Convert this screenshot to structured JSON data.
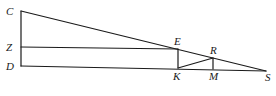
{
  "diagram": {
    "type": "geometry",
    "points": {
      "C": {
        "label": "C",
        "x": 21,
        "y": 11,
        "lx": 6,
        "ly": 15
      },
      "Z": {
        "label": "Z",
        "x": 21,
        "y": 47,
        "lx": 6,
        "ly": 51
      },
      "D": {
        "label": "D",
        "x": 21,
        "y": 66,
        "lx": 6,
        "ly": 70
      },
      "E": {
        "label": "E",
        "x": 178,
        "y": 49,
        "lx": 174,
        "ly": 45
      },
      "K": {
        "label": "K",
        "x": 178,
        "y": 68,
        "lx": 173,
        "ly": 80
      },
      "R": {
        "label": "R",
        "x": 213,
        "y": 58,
        "lx": 210,
        "ly": 54
      },
      "M": {
        "label": "M",
        "x": 213,
        "y": 69,
        "lx": 209,
        "ly": 80
      },
      "S": {
        "label": "S",
        "x": 266,
        "y": 71,
        "lx": 265,
        "ly": 81
      }
    },
    "segments": [
      [
        "C",
        "D"
      ],
      [
        "C",
        "S"
      ],
      [
        "D",
        "S"
      ],
      [
        "Z",
        "E"
      ],
      [
        "E",
        "K"
      ],
      [
        "K",
        "R"
      ],
      [
        "R",
        "M"
      ]
    ]
  }
}
